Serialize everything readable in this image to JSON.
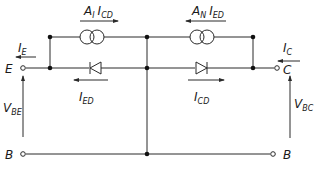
{
  "diagram": {
    "terminals": {
      "emitter": "E",
      "collector": "C",
      "base_left": "B",
      "base_right": "B"
    },
    "currents": {
      "emitter": {
        "main": "I",
        "sub": "E"
      },
      "collector": {
        "main": "I",
        "sub": "C"
      },
      "emitter_diode": {
        "main": "I",
        "sub": "ED"
      },
      "collector_diode": {
        "main": "I",
        "sub": "CD"
      }
    },
    "sources": {
      "forward": {
        "gain": "A",
        "gain_sub": "I",
        "current": "I",
        "current_sub": "CD"
      },
      "reverse": {
        "gain": "A",
        "gain_sub": "N",
        "current": "I",
        "current_sub": "ED"
      }
    },
    "voltages": {
      "base_emitter": {
        "main": "V",
        "sub": "BE"
      },
      "base_collector": {
        "main": "V",
        "sub": "BC"
      }
    },
    "components": [
      {
        "id": "current-source-left",
        "type": "current-source",
        "label": "A_I I_CD"
      },
      {
        "id": "current-source-right",
        "type": "current-source",
        "label": "A_N I_ED"
      },
      {
        "id": "diode-emitter",
        "type": "diode",
        "label": "I_ED"
      },
      {
        "id": "diode-collector",
        "type": "diode",
        "label": "I_CD"
      }
    ],
    "colors": {
      "line": "#2a2a2a",
      "background": "#ffffff"
    }
  }
}
